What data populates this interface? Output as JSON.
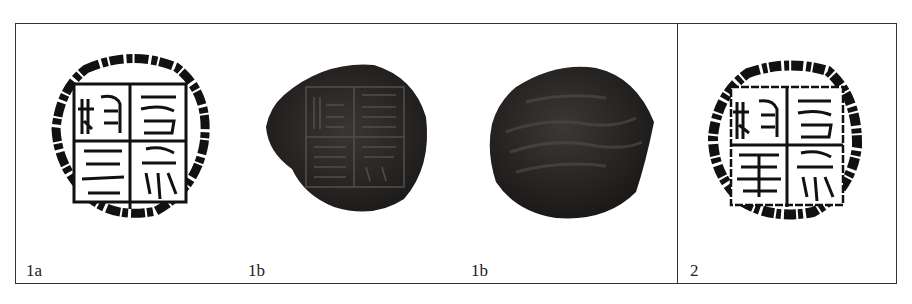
{
  "figure": {
    "panels": [
      {
        "id": "1a",
        "label": "1a",
        "description": "Ink rubbing of square seal, four-character inscription divided by cross lines"
      },
      {
        "id": "1b-front",
        "label": "1b",
        "description": "Photograph of clay sealing, stamped face"
      },
      {
        "id": "1b-back",
        "label": "1b",
        "description": "Photograph of clay sealing, reverse side"
      },
      {
        "id": "2",
        "label": "2",
        "description": "Ink rubbing of a second seal with similar four-character inscription"
      }
    ]
  },
  "colors": {
    "border": "#333333",
    "ink": "#111111",
    "clay": "#2a2724",
    "clay_light": "#4a4540"
  }
}
